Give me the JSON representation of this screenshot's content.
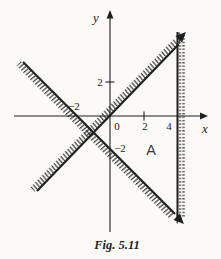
{
  "figure": {
    "caption": "Fig. 5.11",
    "region_label": "A",
    "axis": {
      "x_label": "x",
      "y_label": "y",
      "origin": "0"
    },
    "tick_labels": {
      "x_2": "2",
      "x_4": "4",
      "y_2": "2",
      "x_neg2": "−2",
      "y_neg2": "−2"
    },
    "boundaries": [
      {
        "name": "line-y-equals-x",
        "slope": 1,
        "intercept": 0,
        "hatched_side": "upper-left",
        "arrow_end": "upper-right"
      },
      {
        "name": "line-through-minus2-0-and-0-minus2",
        "slope": -1,
        "intercept": -2,
        "hatched_side": "lower-left",
        "arrow_end": "lower-right"
      },
      {
        "name": "vertical-line-x-equals-4",
        "x": 4,
        "hatched_side": "right"
      }
    ],
    "ink_color": "#1f1f1f",
    "paper_color": "#fbfaf7"
  }
}
